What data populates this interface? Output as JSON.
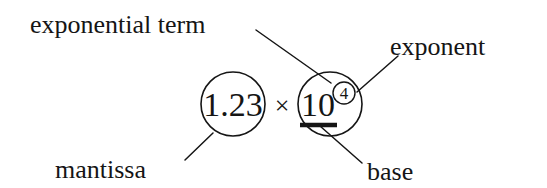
{
  "figure": {
    "background_color": "#ffffff",
    "ink_color": "#151515",
    "formula": {
      "mantissa_value": "1.23",
      "multiplication_sign": "×",
      "base_value": "10",
      "exponent_value": "4",
      "full_expression": "1.23 × 10⁴"
    },
    "labels": {
      "exponential_term": "exponential term",
      "exponent": "exponent",
      "mantissa": "mantissa",
      "base": "base"
    },
    "annotations": {
      "mantissa_circle": "circle around 1.23",
      "exponential_term_circle": "circle around 10 to the 4",
      "exponent_circle": "circle around exponent 4",
      "base_underline": "thick underline beneath 10"
    }
  }
}
